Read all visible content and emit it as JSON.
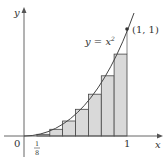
{
  "figure": {
    "curve_label": "y = x",
    "curve_exponent": "2",
    "point_label": "(1, 1)",
    "x_axis_label": "x",
    "y_axis_label": "y",
    "origin_label": "0",
    "tick_one_label": "1",
    "tick_eighth_num": "1",
    "tick_eighth_den": "8",
    "colors": {
      "rect_fill": "#d9d9d9",
      "stroke": "#444444",
      "axis": "#555555"
    }
  },
  "diagram_data": {
    "type": "left-riemann-sum",
    "function": "y = x^2",
    "interval": [
      0,
      1
    ],
    "n_rectangles": 8,
    "width": 0.125,
    "rect_heights": [
      0,
      0.015625,
      0.0625,
      0.140625,
      0.25,
      0.390625,
      0.5625,
      0.765625
    ],
    "marked_point": [
      1,
      1
    ]
  }
}
